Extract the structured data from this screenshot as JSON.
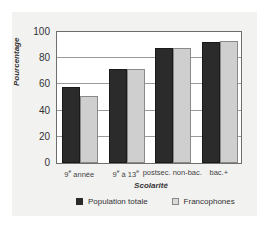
{
  "chart_data": {
    "type": "bar",
    "title": "",
    "xlabel": "Scolarité",
    "ylabel": "Pourcentage",
    "ylim": [
      0,
      100
    ],
    "yticks": [
      0,
      20,
      40,
      60,
      80,
      100
    ],
    "grid": true,
    "legend_position": "bottom",
    "categories": [
      "9e année",
      "9e à 13e",
      "postsec. non-bac.",
      "bac.+"
    ],
    "category_labels": [
      {
        "main": "9",
        "sup": "e",
        "rest": " année"
      },
      {
        "main": "9",
        "sup": "e",
        "rest": " à 13",
        "sup2": "e"
      },
      {
        "main": "postsec. non-bac.",
        "sup": "",
        "rest": ""
      },
      {
        "main": "bac.+",
        "sup": "",
        "rest": ""
      }
    ],
    "series": [
      {
        "name": "Population totale",
        "color": "#2b2b2b",
        "values": [
          58,
          72,
          88,
          92
        ]
      },
      {
        "name": "Francophones",
        "color": "#cfcfcf",
        "values": [
          51,
          72,
          88,
          93
        ]
      }
    ]
  },
  "legend": {
    "items": [
      "Population totale",
      "Francophones"
    ]
  }
}
